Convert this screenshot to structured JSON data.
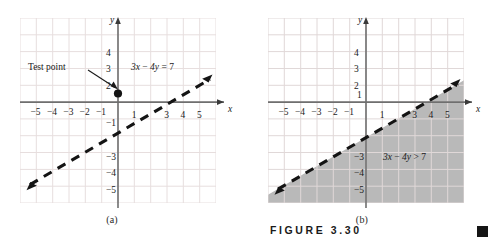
{
  "figure": {
    "label": "FIGURE 3.30",
    "end_marker": "black-square"
  },
  "panels": [
    {
      "id": "a",
      "caption": "(a)",
      "axis_x_label": "x",
      "axis_y_label": "y",
      "x_ticks": [
        "−5",
        "−4",
        "−3",
        "−2",
        "−1",
        "1",
        "3",
        "4",
        "5"
      ],
      "y_ticks": [
        "4",
        "3",
        "2",
        "−1",
        "−3",
        "−4",
        "−5"
      ],
      "line_equation": "3x − 4y = 7",
      "annotation": "Test point",
      "shaded": false
    },
    {
      "id": "b",
      "caption": "(b)",
      "axis_x_label": "x",
      "axis_y_label": "y",
      "x_ticks": [
        "−5",
        "−4",
        "−3",
        "−2",
        "−1",
        "1",
        "3",
        "4",
        "5"
      ],
      "y_ticks": [
        "4",
        "3",
        "2",
        "1",
        "−3",
        "−4",
        "−5"
      ],
      "inequality": "3x − 4y > 7",
      "shaded": true
    }
  ],
  "chart_data": {
    "type": "line",
    "title": "FIGURE 3.30",
    "charts": [
      {
        "id": "a",
        "caption": "(a)",
        "xlabel": "x",
        "ylabel": "y",
        "xlim": [
          -6,
          6
        ],
        "ylim": [
          -6,
          5
        ],
        "grid": true,
        "xticks": [
          -5,
          -4,
          -3,
          -2,
          -1,
          1,
          3,
          4,
          5
        ],
        "yticks": [
          4,
          3,
          2,
          -1,
          -3,
          -4,
          -5
        ],
        "series": [
          {
            "name": "3x − 4y = 7",
            "kind": "dashed-line",
            "equation": "3x - 4y = 7",
            "slope": 0.75,
            "intercept": -1.75,
            "style": "dashed",
            "arrows": "both",
            "label": "3x − 4y = 7"
          },
          {
            "name": "Test point",
            "kind": "point",
            "x": 0,
            "y": 1.5,
            "label": "Test point"
          }
        ]
      },
      {
        "id": "b",
        "caption": "(b)",
        "xlabel": "x",
        "ylabel": "y",
        "xlim": [
          -6,
          6
        ],
        "ylim": [
          -6,
          5
        ],
        "grid": true,
        "xticks": [
          -5,
          -4,
          -3,
          -2,
          -1,
          1,
          3,
          4,
          5
        ],
        "yticks": [
          4,
          3,
          2,
          1,
          -3,
          -4,
          -5
        ],
        "series": [
          {
            "name": "3x − 4y = 7",
            "kind": "dashed-line",
            "equation": "3x - 4y = 7",
            "slope": 0.75,
            "intercept": -1.75,
            "style": "dashed",
            "arrows": "both"
          },
          {
            "name": "3x − 4y > 7",
            "kind": "region",
            "inequality": "3x - 4y > 7",
            "side": "below-right",
            "fill": "#b9b9b9",
            "label": "3x − 4y > 7"
          }
        ]
      }
    ]
  },
  "colors": {
    "grid": "#e6dede",
    "axis": "#6f6f6f",
    "line": "#1a1a1a",
    "shade": "#b9b9b9",
    "text": "#1a1a1a"
  }
}
